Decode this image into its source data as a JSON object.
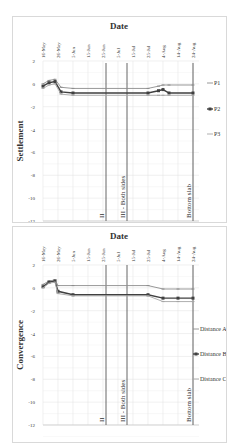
{
  "chart_data": [
    {
      "type": "line",
      "title": "Date",
      "xlabel": "Date",
      "ylabel": "Settlement",
      "x_ticks": [
        "16-May",
        "26-May",
        "5-Jun",
        "15-Jun",
        "25-Jun",
        "5-Jul",
        "15-Jul",
        "25-Jul",
        "4-Aug",
        "14-Aug",
        "24-Aug"
      ],
      "y_ticks": [
        2,
        0,
        -2,
        -4,
        -6,
        -8,
        -10,
        -12
      ],
      "ylim": [
        -12,
        2
      ],
      "grid": true,
      "legend_position": "right",
      "series": [
        {
          "name": "P1",
          "marker": "dash",
          "x": [
            "16-May",
            "20-May",
            "24-May",
            "28-May",
            "5-Jun",
            "25-Jul",
            "1-Aug",
            "4-Aug",
            "8-Aug",
            "24-Aug"
          ],
          "values": [
            0,
            0.3,
            0.4,
            -0.3,
            -0.4,
            -0.4,
            -0.2,
            -0.1,
            -0.1,
            -0.1
          ]
        },
        {
          "name": "P2",
          "marker": "square",
          "x": [
            "16-May",
            "20-May",
            "24-May",
            "28-May",
            "5-Jun",
            "25-Jul",
            "1-Aug",
            "4-Aug",
            "8-Aug",
            "24-Aug"
          ],
          "values": [
            -0.2,
            0.1,
            0.2,
            -0.7,
            -0.8,
            -0.8,
            -0.6,
            -0.5,
            -0.8,
            -0.8
          ]
        },
        {
          "name": "P3",
          "marker": "dash",
          "x": [
            "16-May",
            "20-May",
            "24-May",
            "28-May",
            "5-Jun",
            "25-Jul",
            "1-Aug",
            "4-Aug",
            "8-Aug",
            "24-Aug"
          ],
          "values": [
            -0.4,
            -0.1,
            0.0,
            -0.9,
            -1.0,
            -1.0,
            -1.0,
            -1.0,
            -1.0,
            -1.0
          ]
        }
      ],
      "annotations": [
        {
          "text": "II",
          "x": "27-Jun"
        },
        {
          "text": "III - Both sides",
          "x": "11-Jul"
        },
        {
          "text": "Bottom slab",
          "x": "24-Aug"
        }
      ]
    },
    {
      "type": "line",
      "title": "Date",
      "xlabel": "Date",
      "ylabel": "Convergence",
      "x_ticks": [
        "16-May",
        "26-May",
        "5-Jun",
        "15-Jun",
        "25-Jun",
        "5-Jul",
        "15-Jul",
        "25-Jul",
        "4-Aug",
        "14-Aug",
        "24-Aug"
      ],
      "y_ticks": [
        2,
        0,
        -2,
        -4,
        -6,
        -8,
        -10,
        -12
      ],
      "ylim": [
        -12,
        2
      ],
      "grid": true,
      "legend_position": "right",
      "series": [
        {
          "name": "Distance A",
          "marker": "dash",
          "x": [
            "16-May",
            "20-May",
            "24-May",
            "26-May",
            "5-Jun",
            "25-Jul",
            "4-Aug",
            "14-Aug",
            "24-Aug"
          ],
          "values": [
            0.3,
            0.6,
            0.7,
            0.2,
            0.2,
            0.2,
            -0.1,
            -0.1,
            -0.1
          ]
        },
        {
          "name": "Distance B",
          "marker": "square",
          "x": [
            "16-May",
            "20-May",
            "24-May",
            "26-May",
            "5-Jun",
            "25-Jul",
            "4-Aug",
            "14-Aug",
            "24-Aug"
          ],
          "values": [
            0.1,
            0.5,
            0.6,
            -0.3,
            -0.6,
            -0.6,
            -0.9,
            -0.9,
            -0.9
          ]
        },
        {
          "name": "Distance C",
          "marker": "dash",
          "x": [
            "16-May",
            "20-May",
            "24-May",
            "26-May",
            "5-Jun",
            "25-Jul",
            "4-Aug",
            "14-Aug",
            "24-Aug"
          ],
          "values": [
            0.0,
            0.4,
            0.5,
            -0.5,
            -0.7,
            -0.7,
            -1.2,
            -1.2,
            -1.2
          ]
        }
      ],
      "annotations": [
        {
          "text": "II",
          "x": "27-Jun"
        },
        {
          "text": "III - Both sides",
          "x": "11-Jul"
        },
        {
          "text": "Bottom slab",
          "x": "24-Aug"
        }
      ]
    }
  ]
}
